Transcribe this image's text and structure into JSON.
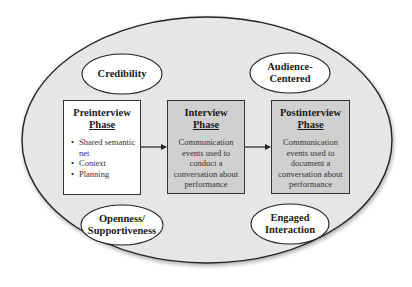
{
  "diagram": {
    "outer_ellipse": {
      "fill": "#e6e6e6",
      "stroke": "#222222"
    },
    "qualities": [
      {
        "id": "credibility",
        "label": "Credibility"
      },
      {
        "id": "audience-centered",
        "label_line1": "Audience-",
        "label_line2": "Centered"
      },
      {
        "id": "openness",
        "label_line1": "Openness/",
        "label_line2": "Supportiveness"
      },
      {
        "id": "engaged",
        "label_line1": "Engaged",
        "label_line2": "Interaction"
      }
    ],
    "phases": [
      {
        "id": "preinterview",
        "title_line1": "Preinterview",
        "title_line2": "Phase",
        "fill": "#ffffff",
        "bullets": [
          "Shared semantic net",
          "Context",
          "Planning"
        ]
      },
      {
        "id": "interview",
        "title_line1": "Interview",
        "title_line2": "Phase",
        "fill": "#d0d0d0",
        "description": "Communication events used to conduct a conversation about performance"
      },
      {
        "id": "postinterview",
        "title_line1": "Postinterview",
        "title_line2": "Phase",
        "fill": "#d0d0d0",
        "description": "Communication events used to document a conversation about performance"
      }
    ],
    "arrows": [
      {
        "from": "preinterview",
        "to": "interview"
      },
      {
        "from": "interview",
        "to": "postinterview"
      }
    ]
  }
}
